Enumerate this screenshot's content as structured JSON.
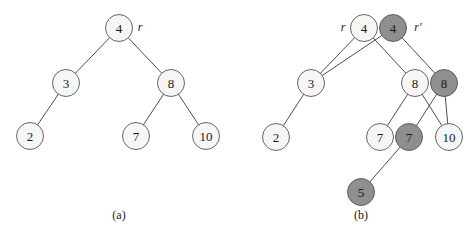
{
  "figure": {
    "colors": {
      "light_node": "#f6f6f6",
      "dark_node": "#8f8f8f",
      "stroke": "#555555"
    },
    "panel_a": {
      "caption": "(a)",
      "root_pointer": "r",
      "nodes": [
        {
          "id": "a4",
          "label": "4",
          "x": 119,
          "y": 28,
          "shade": "light"
        },
        {
          "id": "a3",
          "label": "3",
          "x": 66,
          "y": 83,
          "shade": "light"
        },
        {
          "id": "a8",
          "label": "8",
          "x": 171,
          "y": 83,
          "shade": "light"
        },
        {
          "id": "a2",
          "label": "2",
          "x": 30,
          "y": 136,
          "shade": "light"
        },
        {
          "id": "a7",
          "label": "7",
          "x": 136,
          "y": 136,
          "shade": "light"
        },
        {
          "id": "a10",
          "label": "10",
          "x": 206,
          "y": 136,
          "shade": "light"
        }
      ],
      "edges": [
        [
          "a4",
          "a3"
        ],
        [
          "a4",
          "a8"
        ],
        [
          "a3",
          "a2"
        ],
        [
          "a8",
          "a7"
        ],
        [
          "a8",
          "a10"
        ]
      ]
    },
    "panel_b": {
      "caption": "(b)",
      "root_pointer_old": "r",
      "root_pointer_new": "r′",
      "nodes": [
        {
          "id": "b4",
          "label": "4",
          "x": 364,
          "y": 28,
          "shade": "light"
        },
        {
          "id": "b4n",
          "label": "4",
          "x": 393,
          "y": 28,
          "shade": "dark"
        },
        {
          "id": "b3",
          "label": "3",
          "x": 311,
          "y": 83,
          "shade": "light"
        },
        {
          "id": "b8",
          "label": "8",
          "x": 415,
          "y": 83,
          "shade": "light"
        },
        {
          "id": "b8n",
          "label": "8",
          "x": 444,
          "y": 83,
          "shade": "dark"
        },
        {
          "id": "b2",
          "label": "2",
          "x": 276,
          "y": 137,
          "shade": "light"
        },
        {
          "id": "b7",
          "label": "7",
          "x": 380,
          "y": 137,
          "shade": "light"
        },
        {
          "id": "b7n",
          "label": "7",
          "x": 409,
          "y": 137,
          "shade": "dark"
        },
        {
          "id": "b10",
          "label": "10",
          "x": 449,
          "y": 137,
          "shade": "light"
        },
        {
          "id": "b5",
          "label": "5",
          "x": 361,
          "y": 192,
          "shade": "dark"
        }
      ],
      "edges": [
        [
          "b4",
          "b3"
        ],
        [
          "b4",
          "b8"
        ],
        [
          "b4n",
          "b3"
        ],
        [
          "b4n",
          "b8n"
        ],
        [
          "b3",
          "b2"
        ],
        [
          "b8",
          "b7"
        ],
        [
          "b8",
          "b10"
        ],
        [
          "b8n",
          "b7n"
        ],
        [
          "b8n",
          "b10"
        ],
        [
          "b7n",
          "b5"
        ]
      ]
    }
  }
}
